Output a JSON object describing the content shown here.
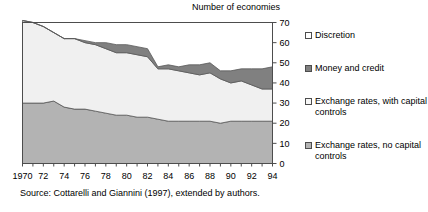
{
  "chart_data": {
    "type": "area",
    "title": "Number of economies",
    "xlabel": "",
    "ylabel": "",
    "stacked": true,
    "grid": false,
    "legend_position": "right",
    "xlim": [
      1970,
      1994
    ],
    "ylim": [
      0,
      70
    ],
    "yticks": [
      0,
      10,
      20,
      30,
      40,
      50,
      60,
      70
    ],
    "x": [
      1970,
      1971,
      1972,
      1973,
      1974,
      1975,
      1976,
      1977,
      1978,
      1979,
      1980,
      1981,
      1982,
      1983,
      1984,
      1985,
      1986,
      1987,
      1988,
      1989,
      1990,
      1991,
      1992,
      1993,
      1994
    ],
    "xtick_labels": [
      "1970",
      "72",
      "74",
      "76",
      "78",
      "80",
      "82",
      "84",
      "86",
      "88",
      "90",
      "92",
      "94"
    ],
    "xtick_values": [
      1970,
      1972,
      1974,
      1976,
      1978,
      1980,
      1982,
      1984,
      1986,
      1988,
      1990,
      1992,
      1994
    ],
    "series": [
      {
        "name": "Exchange rates, no capital controls",
        "color": "#b3b3b3",
        "values": [
          30,
          30,
          30,
          31,
          28,
          27,
          27,
          26,
          25,
          24,
          24,
          23,
          23,
          22,
          21,
          21,
          21,
          21,
          21,
          20,
          21,
          21,
          21,
          21,
          21
        ]
      },
      {
        "name": "Exchange rates, with capital controls",
        "color": "#f0f0f0",
        "values": [
          41,
          40,
          38,
          34,
          34,
          35,
          33,
          33,
          32,
          31,
          31,
          31,
          30,
          25,
          26,
          25,
          24,
          23,
          24,
          22,
          19,
          20,
          18,
          16,
          16
        ]
      },
      {
        "name": "Money and credit",
        "color": "#808080",
        "values": [
          0,
          0,
          0,
          0,
          0,
          0,
          1,
          1,
          3,
          4,
          4,
          4,
          4,
          1,
          2,
          2,
          4,
          5,
          5,
          4,
          6,
          6,
          8,
          10,
          11
        ]
      },
      {
        "name": "Discretion",
        "color": "#ffffff",
        "values": [
          0,
          0,
          0,
          0,
          0,
          0,
          0,
          0,
          0,
          0,
          0,
          0,
          0,
          0,
          0,
          0,
          0,
          0,
          0,
          0,
          0,
          0,
          0,
          0,
          0
        ]
      }
    ],
    "totals": [
      71,
      70,
      68,
      65,
      62,
      62,
      61,
      60,
      60,
      59,
      59,
      58,
      57,
      48,
      49,
      48,
      49,
      49,
      50,
      46,
      46,
      47,
      47,
      47,
      48
    ]
  },
  "legend": {
    "items": [
      {
        "label": "Discretion",
        "color": "#ffffff"
      },
      {
        "label": "Money and credit",
        "color": "#808080"
      },
      {
        "label": "Exchange rates, with capital controls",
        "color": "#f7f7f7"
      },
      {
        "label": "Exchange rates, no capital controls",
        "color": "#b3b3b3"
      }
    ]
  },
  "source": {
    "text": "Source: Cottarelli and Giannini (1997), extended by authors."
  }
}
